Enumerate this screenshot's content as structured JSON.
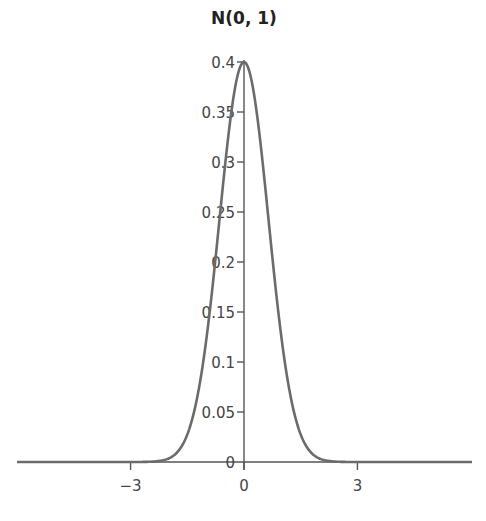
{
  "chart_data": {
    "type": "line",
    "title": "N(0, 1)",
    "xlabel": "",
    "ylabel": "",
    "function": "standard normal probability density",
    "xlim": [
      -6,
      6
    ],
    "ylim": [
      0,
      0.4
    ],
    "x_ticks": [
      -3,
      0,
      3
    ],
    "x_tick_labels": [
      "−3",
      "0",
      "3"
    ],
    "y_ticks": [
      0,
      0.05,
      0.1,
      0.15,
      0.2,
      0.25,
      0.3,
      0.35,
      0.4
    ],
    "y_tick_labels": [
      "0",
      "0.05",
      "0.1",
      "0.15",
      "0.2",
      "0.25",
      "0.3",
      "0.35",
      "0.4"
    ],
    "grid": false,
    "legend": null,
    "series": [
      {
        "name": "N(0, 1)",
        "x": [
          -3,
          -2,
          -1.5,
          -1,
          -0.5,
          0,
          0.5,
          1,
          1.5,
          2,
          3
        ],
        "y": [
          0.004,
          0.054,
          0.13,
          0.242,
          0.352,
          0.399,
          0.352,
          0.242,
          0.13,
          0.054,
          0.004
        ]
      }
    ]
  },
  "colors": {
    "curve": "#6b6b6b",
    "axis": "#555555",
    "text": "#444444",
    "title": "#222222"
  }
}
